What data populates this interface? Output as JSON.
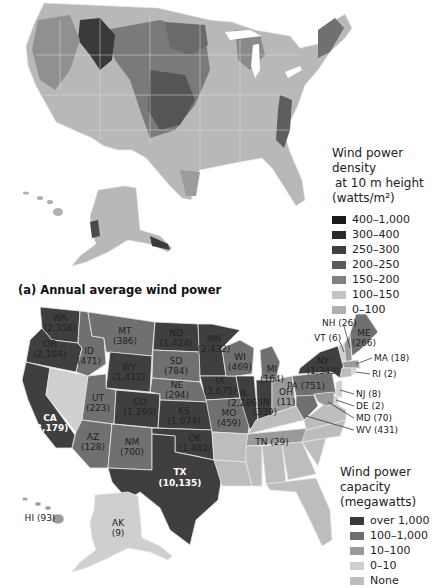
{
  "map_a": {
    "caption": "(a) Annual average wind power",
    "legend": {
      "title_line1": "Wind power density",
      "title_line2": "at 10 m height",
      "title_line3": "(watts/m²)",
      "items": [
        {
          "label": "400–1,000",
          "color": "#1a1a1a"
        },
        {
          "label": "300–400",
          "color": "#2b2b2b"
        },
        {
          "label": "250–300",
          "color": "#404040"
        },
        {
          "label": "200–250",
          "color": "#5a5a5a"
        },
        {
          "label": "150–200",
          "color": "#808080"
        },
        {
          "label": "100–150",
          "color": "#c4c4c4"
        },
        {
          "label": "0–100",
          "color": "#b0b0b0"
        }
      ]
    }
  },
  "map_b": {
    "legend": {
      "title_line1": "Wind power capacity",
      "title_line2": "(megawatts)",
      "items": [
        {
          "label": "over 1,000",
          "color": "#3a3a3a"
        },
        {
          "label": "100–1,000",
          "color": "#6e6e6e"
        },
        {
          "label": "10–100",
          "color": "#9a9a9a"
        },
        {
          "label": "0–10",
          "color": "#cfcfcf"
        },
        {
          "label": "None",
          "color": "#bdbdbd"
        }
      ]
    },
    "states": {
      "WA": {
        "abbr": "WA",
        "value": "(2,356)"
      },
      "OR": {
        "abbr": "OR",
        "value": "(2,104)"
      },
      "CA": {
        "abbr": "CA",
        "value": "(3,179)"
      },
      "ID": {
        "abbr": "ID",
        "value": "(471)"
      },
      "MT": {
        "abbr": "MT",
        "value": "(386)"
      },
      "WY": {
        "abbr": "WY",
        "value": "(1,412)"
      },
      "UT": {
        "abbr": "UT",
        "value": "(223)"
      },
      "CO": {
        "abbr": "CO",
        "value": "(1,299)"
      },
      "AZ": {
        "abbr": "AZ",
        "value": "(128)"
      },
      "NM": {
        "abbr": "NM",
        "value": "(700)"
      },
      "ND": {
        "abbr": "ND",
        "value": "(1,424)"
      },
      "SD": {
        "abbr": "SD",
        "value": "(784)"
      },
      "NE": {
        "abbr": "NE",
        "value": "(294)"
      },
      "KS": {
        "abbr": "KS",
        "value": "(1,074)"
      },
      "OK": {
        "abbr": "OK",
        "value": "(1,482)"
      },
      "TX": {
        "abbr": "TX",
        "value": "(10,135)"
      },
      "MN": {
        "abbr": "MN",
        "value": "(2,432)"
      },
      "IA": {
        "abbr": "IA",
        "value": "(3,675)"
      },
      "MO": {
        "abbr": "MO",
        "value": "(459)"
      },
      "WI": {
        "abbr": "WI",
        "value": "(469)"
      },
      "IL": {
        "abbr": "IL",
        "value": "(2,286)"
      },
      "MI": {
        "abbr": "MI",
        "value": "(164)"
      },
      "IN": {
        "abbr": "IN",
        "value": "(339)"
      },
      "OH": {
        "abbr": "OH",
        "value": "(11)"
      },
      "PA": {
        "abbr": "PA",
        "value": "(751)"
      },
      "NY": {
        "abbr": "NY",
        "value": "(1,349)"
      },
      "ME": {
        "abbr": "ME",
        "value": "(266)"
      },
      "TN": {
        "label": "TN (29)"
      },
      "AK": {
        "abbr": "AK",
        "value": "(9)"
      },
      "HI": {
        "label": "HI (93)"
      },
      "NH": {
        "label": "NH (26)"
      },
      "VT": {
        "label": "VT (6)"
      },
      "MA": {
        "label": "MA (18)"
      },
      "RI": {
        "label": "RI (2)"
      },
      "NJ": {
        "label": "NJ (8)"
      },
      "DE": {
        "label": "DE (2)"
      },
      "MD": {
        "label": "MD (70)"
      },
      "WV": {
        "label": "WV (431)"
      }
    }
  }
}
